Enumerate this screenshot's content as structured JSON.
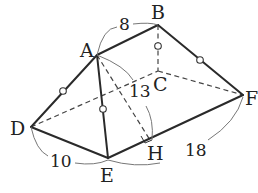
{
  "figure": {
    "type": "solid-geometry",
    "vertices": {
      "A": {
        "label": "A",
        "x": 97,
        "y": 55
      },
      "B": {
        "label": "B",
        "x": 158,
        "y": 25
      },
      "C": {
        "label": "C",
        "x": 158,
        "y": 71
      },
      "D": {
        "label": "D",
        "x": 31,
        "y": 127
      },
      "E": {
        "label": "E",
        "x": 108,
        "y": 158
      },
      "F": {
        "label": "F",
        "x": 243,
        "y": 95
      },
      "H": {
        "label": "H",
        "x": 150,
        "y": 140
      }
    },
    "solid_edges": [
      "AB",
      "BF",
      "AD",
      "AE",
      "DE",
      "EF"
    ],
    "dashed_edges": [
      "DC",
      "CF",
      "BC",
      "AH"
    ],
    "equal_marks": [
      "AD",
      "AE",
      "BC",
      "BF"
    ],
    "right_angle_at": "H",
    "measurements": {
      "AB": "8",
      "AH": "13",
      "DE": "10",
      "EF": "18"
    }
  }
}
